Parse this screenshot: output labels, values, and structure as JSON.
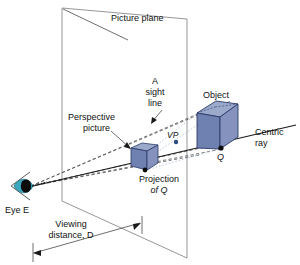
{
  "diagram": {
    "colors": {
      "cube_front": "#6f81b0",
      "cube_top": "#9ba9cb",
      "cube_side": "#8492bd",
      "outline": "#2b3a6b",
      "plane_line": "#8a8a8a",
      "ray": "#1a1a1a",
      "dashed": "#555555",
      "eye_iris": "#3aa8bf",
      "eye_pupil": "#0d0d0d",
      "text": "#111111"
    },
    "labels": {
      "picture_plane": "Picture plane",
      "sight_line_l1": "A",
      "sight_line_l2": "sight",
      "sight_line_l3": "line",
      "perspective_picture_l1": "Perspective",
      "perspective_picture_l2": "picture",
      "object": "Object",
      "centric_ray_l1": "Centric",
      "centric_ray_l2": "ray",
      "vanishing_point": "VP",
      "point_q": "Q",
      "projection_of_q_l1": "Projection",
      "projection_of_q_l2": "of Q",
      "eye_e": "Eye E",
      "viewing_distance_l1": "Viewing",
      "viewing_distance_l2": "distance, D"
    },
    "icons": {
      "eye": "eye-icon",
      "object_cube": "cube-icon",
      "image_cube": "small-cube-icon",
      "point_marker": "dot-icon",
      "arrowhead": "arrowhead-icon"
    }
  }
}
